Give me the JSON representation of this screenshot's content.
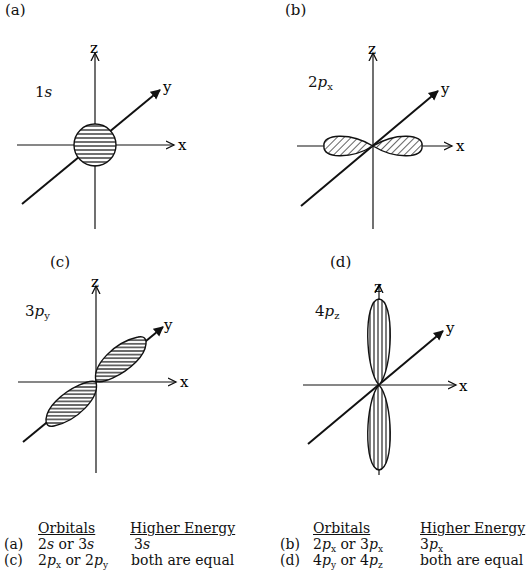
{
  "panels": [
    {
      "id": "a",
      "label": "(a)",
      "orbital_num": "1",
      "orbital_letter": "s",
      "orbital_sub": "",
      "axes": [
        "z",
        "y",
        "x"
      ],
      "shape": "sphere",
      "hatch": "horizontal"
    },
    {
      "id": "b",
      "label": "(b)",
      "orbital_num": "2",
      "orbital_letter": "p",
      "orbital_sub": "x",
      "axes": [
        "z",
        "y",
        "x"
      ],
      "shape": "lobes-along-x",
      "hatch": "diagonal"
    },
    {
      "id": "c",
      "label": "(c)",
      "orbital_num": "3",
      "orbital_letter": "p",
      "orbital_sub": "y",
      "axes": [
        "z",
        "y",
        "x"
      ],
      "shape": "lobes-along-y",
      "hatch": "horizontal"
    },
    {
      "id": "d",
      "label": "(d)",
      "orbital_num": "4",
      "orbital_letter": "p",
      "orbital_sub": "z",
      "axes": [
        "z",
        "y",
        "x"
      ],
      "shape": "lobes-along-z",
      "hatch": "vertical"
    }
  ],
  "table": {
    "headers": {
      "orbitals": "Orbitals",
      "higher_energy": "Higher Energy"
    },
    "rows": [
      {
        "label": "(a)",
        "orbitals": "2s or 3s",
        "higher": "3s"
      },
      {
        "label": "(c)",
        "orbitals": "2px or 2py",
        "higher": "both are equal"
      },
      {
        "label": "(b)",
        "orbitals": "2px or 3px",
        "higher": "3px"
      },
      {
        "label": "(d)",
        "orbitals": "4py or 4pz",
        "higher": "both are equal"
      }
    ]
  }
}
